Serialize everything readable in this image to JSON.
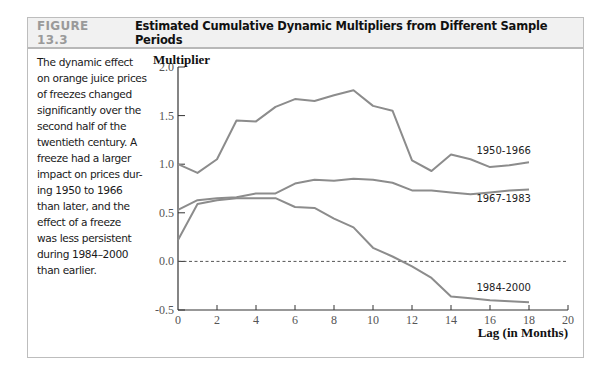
{
  "figure": {
    "number": "FIGURE 13.3",
    "title": "Estimated Cumulative Dynamic Multipliers from Different Sample Periods",
    "caption": "The dynamic effect on orange juice prices of freezes changed significantly over the second half of the twentieth century. A freeze had a larger impact on prices during 1950 to 1966 than later, and the effect of a freeze was less persistent during 1984–2000 than earlier.",
    "caption_lines": [
      "The dynamic effect",
      "on orange juice prices",
      "of freezes changed",
      "significantly over the",
      "second half of the",
      "twentieth century. A",
      "freeze had a larger",
      "impact on prices dur-",
      "ing 1950 to 1966",
      "than later, and the",
      "effect of a freeze",
      "was less persistent",
      "during 1984–2000",
      "than earlier."
    ]
  },
  "colors": {
    "series_line": "#8c8c8c",
    "axis": "#333333",
    "header_bg": "#f1f1f1",
    "figure_number": "#9a9a9a",
    "zero_line": "#555555"
  },
  "chart_data": {
    "type": "line",
    "title": "Estimated Cumulative Dynamic Multipliers from Different Sample Periods",
    "xlabel": "Lag (in Months)",
    "ylabel": "Multiplier",
    "xlim": [
      0,
      20
    ],
    "ylim": [
      -0.5,
      2.0
    ],
    "x_ticks": [
      0,
      2,
      4,
      6,
      8,
      10,
      12,
      14,
      16,
      18,
      20
    ],
    "x_tick_labels": [
      "0",
      "2",
      "4",
      "6",
      "8",
      "10",
      "12",
      "14",
      "16",
      "18",
      "20"
    ],
    "y_ticks": [
      -0.5,
      0.0,
      0.5,
      1.0,
      1.5,
      2.0
    ],
    "y_tick_labels": [
      "-0.5",
      "0.0",
      "0.5",
      "1.0",
      "1.5",
      "2.0"
    ],
    "grid": false,
    "reference_line": {
      "y": 0.0,
      "style": "dashed"
    },
    "legend_position": "inline labels at right end of each series",
    "x": [
      0,
      1,
      2,
      3,
      4,
      5,
      6,
      7,
      8,
      9,
      10,
      11,
      12,
      13,
      14,
      15,
      16,
      17,
      18
    ],
    "series": [
      {
        "name": "1950-1966",
        "values": [
          1.0,
          0.91,
          1.05,
          1.45,
          1.44,
          1.59,
          1.67,
          1.65,
          1.71,
          1.76,
          1.6,
          1.55,
          1.04,
          0.93,
          1.1,
          1.05,
          0.97,
          0.99,
          1.02
        ],
        "label_pos": {
          "x": 16.7,
          "y": 1.11
        }
      },
      {
        "name": "1967-1983",
        "values": [
          0.53,
          0.63,
          0.65,
          0.66,
          0.7,
          0.7,
          0.8,
          0.84,
          0.83,
          0.85,
          0.84,
          0.81,
          0.73,
          0.73,
          0.71,
          0.69,
          0.71,
          0.73,
          0.74
        ],
        "label_pos": {
          "x": 16.7,
          "y": 0.61
        }
      },
      {
        "name": "1984-2000",
        "values": [
          0.22,
          0.59,
          0.63,
          0.65,
          0.65,
          0.65,
          0.56,
          0.55,
          0.44,
          0.35,
          0.14,
          0.05,
          -0.05,
          -0.17,
          -0.36,
          -0.38,
          -0.4,
          -0.41,
          -0.42
        ],
        "label_pos": {
          "x": 16.7,
          "y": -0.3
        }
      }
    ]
  }
}
